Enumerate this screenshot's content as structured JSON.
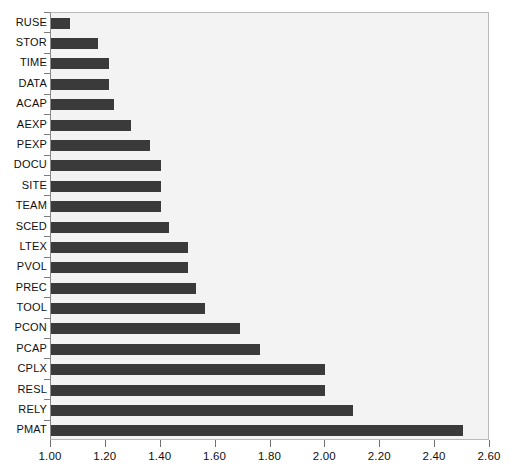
{
  "chart_data": {
    "type": "bar",
    "orientation": "horizontal",
    "title": "",
    "xlabel": "",
    "ylabel": "",
    "xlim": [
      1.0,
      2.6
    ],
    "xticks": [
      "1.00",
      "1.20",
      "1.40",
      "1.60",
      "1.80",
      "2.00",
      "2.20",
      "2.40",
      "2.60"
    ],
    "xtick_values": [
      1.0,
      1.2,
      1.4,
      1.6,
      1.8,
      2.0,
      2.2,
      2.4,
      2.6
    ],
    "grid": false,
    "legend": null,
    "bar_color": "#3a3a3a",
    "plot_background": "#f3f3f3",
    "categories": [
      "RUSE",
      "STOR",
      "TIME",
      "DATA",
      "ACAP",
      "AEXP",
      "PEXP",
      "DOCU",
      "SITE",
      "TEAM",
      "SCED",
      "LTEX",
      "PVOL",
      "PREC",
      "TOOL",
      "PCON",
      "PCAP",
      "CPLX",
      "RESL",
      "RELY",
      "PMAT"
    ],
    "values": [
      1.07,
      1.17,
      1.21,
      1.21,
      1.23,
      1.29,
      1.36,
      1.4,
      1.4,
      1.4,
      1.43,
      1.5,
      1.5,
      1.53,
      1.56,
      1.69,
      1.76,
      2.0,
      2.0,
      2.1,
      2.5
    ],
    "bars": [
      {
        "category": "RUSE",
        "value": 1.07
      },
      {
        "category": "STOR",
        "value": 1.17
      },
      {
        "category": "TIME",
        "value": 1.21
      },
      {
        "category": "DATA",
        "value": 1.21
      },
      {
        "category": "ACAP",
        "value": 1.23
      },
      {
        "category": "AEXP",
        "value": 1.29
      },
      {
        "category": "PEXP",
        "value": 1.36
      },
      {
        "category": "DOCU",
        "value": 1.4
      },
      {
        "category": "SITE",
        "value": 1.4
      },
      {
        "category": "TEAM",
        "value": 1.4
      },
      {
        "category": "SCED",
        "value": 1.43
      },
      {
        "category": "LTEX",
        "value": 1.5
      },
      {
        "category": "PVOL",
        "value": 1.5
      },
      {
        "category": "PREC",
        "value": 1.53
      },
      {
        "category": "TOOL",
        "value": 1.56
      },
      {
        "category": "PCON",
        "value": 1.69
      },
      {
        "category": "PCAP",
        "value": 1.76
      },
      {
        "category": "CPLX",
        "value": 2.0
      },
      {
        "category": "RESL",
        "value": 2.0
      },
      {
        "category": "RELY",
        "value": 2.1
      },
      {
        "category": "PMAT",
        "value": 2.5
      }
    ]
  }
}
